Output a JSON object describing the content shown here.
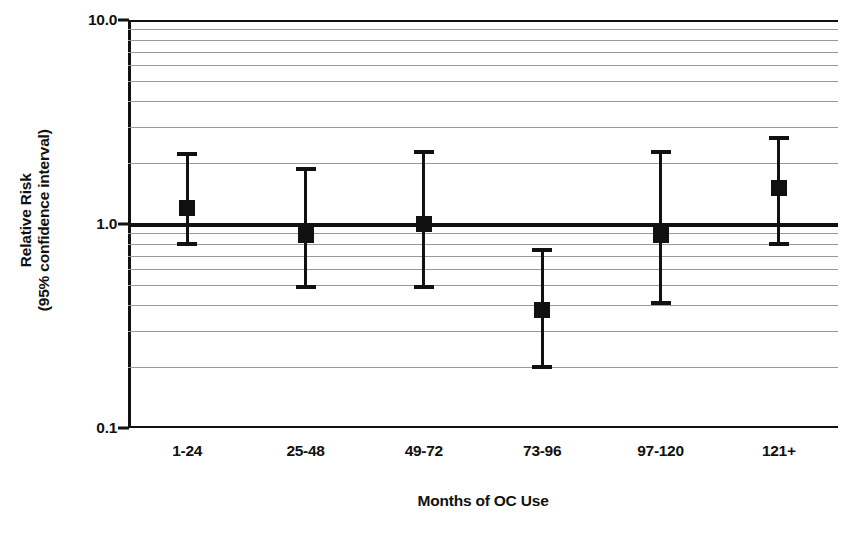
{
  "chart_data": {
    "type": "scatter",
    "title": "",
    "xlabel": "Months of OC Use",
    "ylabel_line1": "Relative Risk",
    "ylabel_line2": "(95% confidence interval)",
    "categories": [
      "1-24",
      "25-48",
      "49-72",
      "73-96",
      "97-120",
      "121+"
    ],
    "values": [
      1.2,
      0.88,
      1.0,
      0.38,
      0.88,
      1.5
    ],
    "ci_lower": [
      0.78,
      0.48,
      0.48,
      0.195,
      0.4,
      0.78
    ],
    "ci_upper": [
      2.25,
      1.9,
      2.3,
      0.76,
      2.3,
      2.7
    ],
    "yscale": "log",
    "ylim": [
      0.1,
      10.0
    ],
    "ytick_labels": [
      "10.0",
      "1.0",
      "0.1"
    ],
    "ytick_values": [
      10.0,
      1.0,
      0.1
    ],
    "gridlines": [
      9,
      8,
      7,
      6,
      5,
      4,
      3,
      2,
      0.9,
      0.8,
      0.7,
      0.6,
      0.5,
      0.4,
      0.3,
      0.2
    ],
    "reference_line": 1.0,
    "grid": true,
    "legend": "none",
    "marker": "filled-square",
    "colors": {
      "data": "#111111",
      "grid": "#9a9a9a",
      "axis": "#111111",
      "background": "#ffffff"
    }
  }
}
